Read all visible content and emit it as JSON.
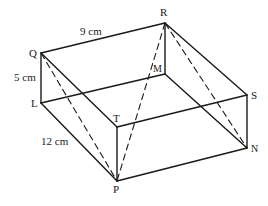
{
  "figure": {
    "type": "cuboid",
    "vertices": {
      "Q": {
        "label": "Q",
        "x": 41,
        "y": 53
      },
      "R": {
        "label": "R",
        "x": 165,
        "y": 23
      },
      "L": {
        "label": "L",
        "x": 41,
        "y": 103
      },
      "M": {
        "label": "M",
        "x": 165,
        "y": 74
      },
      "T": {
        "label": "T",
        "x": 117,
        "y": 127
      },
      "S": {
        "label": "S",
        "x": 247,
        "y": 95
      },
      "P": {
        "label": "P",
        "x": 117,
        "y": 181
      },
      "N": {
        "label": "N",
        "x": 247,
        "y": 148
      }
    },
    "dimensions": {
      "QR": "9 cm",
      "QL": "5 cm",
      "LP": "12 cm"
    },
    "solid_edges": [
      "QR",
      "QL",
      "QT",
      "RM",
      "RS",
      "LM",
      "LP",
      "MN",
      "TP",
      "TS",
      "PN",
      "SN"
    ],
    "dashed_edges": [
      "QP",
      "RP",
      "RN"
    ]
  }
}
